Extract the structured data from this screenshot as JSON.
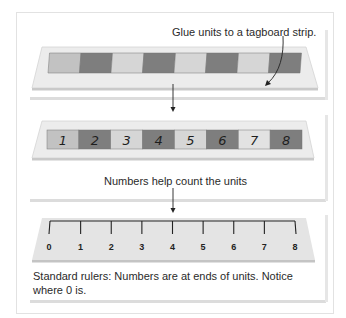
{
  "figure": {
    "panels": [
      {
        "id": "glued-strip",
        "caption": "Glue units to a tagboard strip.",
        "units": 8,
        "unit_colors": [
          "#c2c2c2",
          "#7e7e7e",
          "#d6d6d6",
          "#7e7e7e",
          "#d6d6d6",
          "#7e7e7e",
          "#d6d6d6",
          "#7e7e7e"
        ]
      },
      {
        "id": "numbered-strip",
        "caption": "Numbers help count the units",
        "labels": [
          "1",
          "2",
          "3",
          "4",
          "5",
          "6",
          "7",
          "8"
        ],
        "unit_colors": [
          "#c2c2c2",
          "#7e7e7e",
          "#d6d6d6",
          "#7e7e7e",
          "#d6d6d6",
          "#7e7e7e",
          "#e2e2e2",
          "#7e7e7e"
        ]
      },
      {
        "id": "standard-ruler",
        "tick_labels": [
          "0",
          "1",
          "2",
          "3",
          "4",
          "5",
          "6",
          "7",
          "8"
        ],
        "caption_line1": "Standard rulers: Numbers are at ends of units. Notice",
        "caption_line2": "where 0 is."
      }
    ],
    "colors": {
      "strip_bg": "#ebebeb",
      "strip_edge": "#cfcfcf",
      "dark_unit": "#7e7e7e",
      "light_unit": "#d6d6d6",
      "ink": "#222222"
    }
  }
}
